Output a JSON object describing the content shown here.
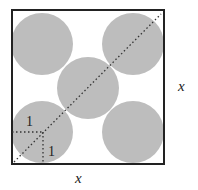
{
  "figure": {
    "type": "circles packed in square",
    "square_side_label": "x",
    "right_label": "x",
    "bottom_label": "x",
    "radius_labels": [
      "1",
      "1"
    ],
    "circle_count": 5,
    "circle_radius": 1,
    "colors": {
      "circle": "#bdbdbd",
      "border": "#222222",
      "dots": "#333333"
    }
  }
}
